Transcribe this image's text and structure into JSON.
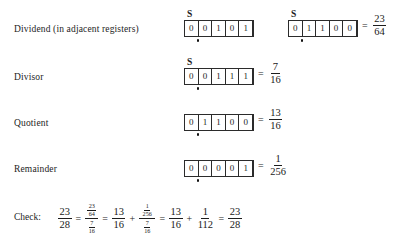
{
  "figure": {
    "sign_label": "S",
    "equals": "=",
    "plus": "+",
    "rows": [
      {
        "label": "Dividend (in adjacent registers)",
        "registers": [
          {
            "bits": [
              "0",
              "0",
              "1",
              "0",
              "1"
            ],
            "show_sign_label": true,
            "show_radix_dot": true
          },
          {
            "bits": [
              "0",
              "1",
              "1",
              "0",
              "0"
            ],
            "show_sign_label": true,
            "show_radix_dot": true
          }
        ],
        "value": {
          "numerator": "23",
          "denominator": "64"
        }
      },
      {
        "label": "Divisor",
        "registers": [
          {
            "bits": [
              "0",
              "0",
              "1",
              "1",
              "1"
            ],
            "show_sign_label": true,
            "show_radix_dot": true
          }
        ],
        "value": {
          "numerator": "7",
          "denominator": "16"
        }
      },
      {
        "label": "Quotient",
        "registers": [
          {
            "bits": [
              "0",
              "1",
              "1",
              "0",
              "0"
            ],
            "show_sign_label": false,
            "show_radix_dot": true
          }
        ],
        "value": {
          "numerator": "13",
          "denominator": "16"
        }
      },
      {
        "label": "Remainder",
        "registers": [
          {
            "bits": [
              "0",
              "0",
              "0",
              "0",
              "1"
            ],
            "show_sign_label": false,
            "show_radix_dot": true
          }
        ],
        "value": {
          "numerator": "1",
          "denominator": "256"
        }
      }
    ],
    "check": {
      "label": "Check:",
      "term1": {
        "numerator": "23",
        "denominator": "28"
      },
      "term2": {
        "numerator": {
          "numerator": "23",
          "denominator": "64"
        },
        "denominator": {
          "numerator": "7",
          "denominator": "16"
        }
      },
      "term3": {
        "numerator": "13",
        "denominator": "16"
      },
      "term4": {
        "numerator": {
          "numerator": "1",
          "denominator": "256"
        },
        "denominator": {
          "numerator": "7",
          "denominator": "16"
        }
      },
      "term5": {
        "numerator": "13",
        "denominator": "16"
      },
      "term6": {
        "numerator": "1",
        "denominator": "112"
      },
      "term7": {
        "numerator": "23",
        "denominator": "28"
      }
    }
  }
}
